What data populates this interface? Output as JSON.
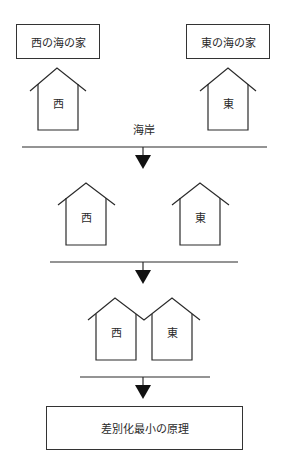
{
  "diagram": {
    "top_labels": {
      "west": "西の海の家",
      "east": "東の海の家"
    },
    "houses": {
      "west_char": "西",
      "east_char": "東"
    },
    "coast_label": "海岸",
    "stages": [
      {
        "name": "initial",
        "description": "Houses at opposite ends of the beach"
      },
      {
        "name": "intermediate",
        "description": "Houses move toward the center"
      },
      {
        "name": "final",
        "description": "Houses adjacent at the center"
      }
    ],
    "conclusion": "差別化最小の原理"
  }
}
